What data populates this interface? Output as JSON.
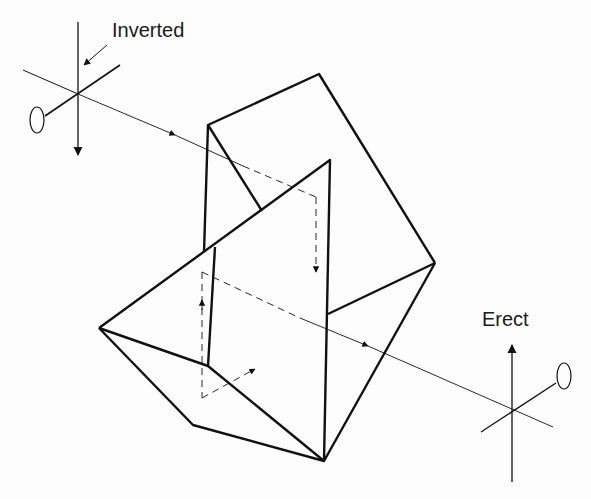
{
  "diagram": {
    "type": "porro-prism-erecting-system",
    "labels": {
      "input": "Inverted",
      "output": "Erect"
    },
    "colors": {
      "line": "#111111",
      "background": "#fdfdfd"
    }
  }
}
